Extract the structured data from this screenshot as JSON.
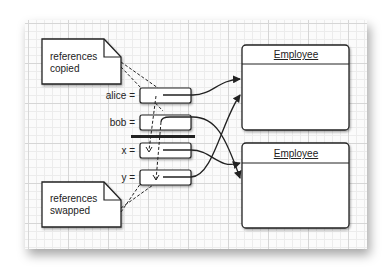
{
  "notes": {
    "top": {
      "line1": "references",
      "line2": "copied"
    },
    "bottom": {
      "line1": "references",
      "line2": "swapped"
    }
  },
  "variables": [
    {
      "label": "alice ="
    },
    {
      "label": "bob ="
    },
    {
      "label": "x ="
    },
    {
      "label": "y ="
    }
  ],
  "objects": [
    {
      "class_name": "Employee"
    },
    {
      "class_name": "Employee"
    }
  ],
  "colors": {
    "line": "#222222",
    "grid_major": "#d6d6d6",
    "grid_minor": "#ececec",
    "box_fill": "#ffffff"
  }
}
